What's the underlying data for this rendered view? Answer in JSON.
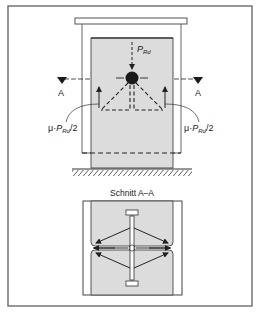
{
  "diagram": {
    "colors": {
      "frame": "#6b6b6b",
      "line": "#3a3a3a",
      "fill": "#dcdcdc",
      "dark": "#1a1a1a"
    },
    "elevation": {
      "load_label_main": "P",
      "load_label_sub": "Rd",
      "section_marker_left": "A",
      "section_marker_right": "A",
      "reaction_left": {
        "mu": "μ·",
        "p": "P",
        "sub": "Rd",
        "tail": "/2"
      },
      "reaction_right": {
        "mu": "μ·",
        "p": "P",
        "sub": "Rd",
        "tail": "/2"
      }
    },
    "section": {
      "title": "Schnitt A–A"
    }
  }
}
